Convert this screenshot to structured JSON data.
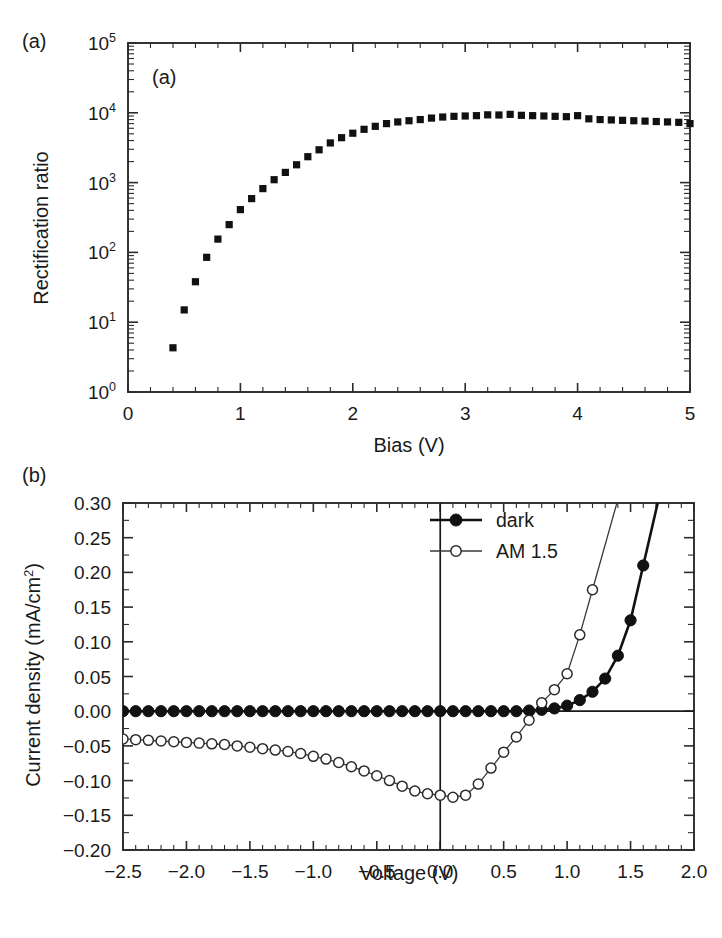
{
  "figure": {
    "panel_a_letter": "(a)",
    "panel_b_letter": "(b)",
    "panel_a_inner_letter": "(a)",
    "panel_b_inner_letter": "(b)"
  },
  "chart_data": [
    {
      "type": "scatter",
      "panel": "(a)",
      "title": "",
      "xlabel": "Bias (V)",
      "ylabel": "Rectification ratio",
      "xlim": [
        0,
        5
      ],
      "ylim": [
        1,
        100000
      ],
      "yscale": "log",
      "grid": false,
      "legend": "none",
      "xticks": [
        0,
        1,
        2,
        3,
        4,
        5
      ],
      "xticklabels": [
        "0",
        "1",
        "2",
        "3",
        "4",
        "5"
      ],
      "xminor_step": 0.2,
      "yticks": [
        1,
        10,
        100,
        1000,
        10000,
        100000
      ],
      "yticklabels": [
        "10^0",
        "10^1",
        "10^2",
        "10^3",
        "10^4",
        "10^5"
      ],
      "marker": "filled-square",
      "x": [
        0.4,
        0.5,
        0.6,
        0.7,
        0.8,
        0.9,
        1.0,
        1.1,
        1.2,
        1.3,
        1.4,
        1.5,
        1.6,
        1.7,
        1.8,
        1.9,
        2.0,
        2.1,
        2.2,
        2.3,
        2.4,
        2.5,
        2.6,
        2.7,
        2.8,
        2.9,
        3.0,
        3.1,
        3.2,
        3.3,
        3.4,
        3.5,
        3.6,
        3.7,
        3.8,
        3.9,
        4.0,
        4.1,
        4.2,
        4.3,
        4.4,
        4.5,
        4.6,
        4.7,
        4.8,
        4.9,
        5.0
      ],
      "y": [
        4.3,
        15,
        38,
        85,
        155,
        250,
        410,
        590,
        820,
        1100,
        1400,
        1800,
        2350,
        2950,
        3700,
        4400,
        5100,
        5800,
        6400,
        7000,
        7400,
        7700,
        8000,
        8400,
        8700,
        8900,
        9000,
        9100,
        9350,
        9300,
        9500,
        9200,
        9100,
        9000,
        8900,
        8800,
        9100,
        8200,
        8000,
        7900,
        7800,
        7700,
        7600,
        7500,
        7400,
        7300,
        7000
      ]
    },
    {
      "type": "line",
      "panel": "(b)",
      "title": "",
      "xlabel": "Voltage (V)",
      "ylabel": "Current density (mA/cm2)",
      "ylabel_display": "Current density (mA/cm",
      "ylabel_sup": "2",
      "ylabel_tail": ")",
      "xlim": [
        -2.5,
        2.0
      ],
      "ylim": [
        -0.2,
        0.3
      ],
      "grid": false,
      "legend": "upper-center",
      "xticks": [
        -2.5,
        -2.0,
        -1.5,
        -1.0,
        -0.5,
        0.0,
        0.5,
        1.0,
        1.5,
        2.0
      ],
      "xticklabels": [
        "-2.5",
        "-2.0",
        "-1.5",
        "-1.0",
        "-0.5",
        "0.0",
        "0.5",
        "1.0",
        "1.5",
        "2.0"
      ],
      "xminor_step": 0.1,
      "yticks": [
        -0.2,
        -0.15,
        -0.1,
        -0.05,
        0.0,
        0.05,
        0.1,
        0.15,
        0.2,
        0.25,
        0.3
      ],
      "yticklabels": [
        "-0.20",
        "-0.15",
        "-0.10",
        "-0.05",
        "0.00",
        "0.05",
        "0.10",
        "0.15",
        "0.20",
        "0.25",
        "0.30"
      ],
      "series": [
        {
          "name": "dark",
          "marker": "filled-circle",
          "linewidth": "thick",
          "x": [
            -2.5,
            -2.4,
            -2.3,
            -2.2,
            -2.1,
            -2.0,
            -1.9,
            -1.8,
            -1.7,
            -1.6,
            -1.5,
            -1.4,
            -1.3,
            -1.2,
            -1.1,
            -1.0,
            -0.9,
            -0.8,
            -0.7,
            -0.6,
            -0.5,
            -0.4,
            -0.3,
            -0.2,
            -0.1,
            0.0,
            0.1,
            0.2,
            0.3,
            0.4,
            0.5,
            0.6,
            0.7,
            0.8,
            0.9,
            1.0,
            1.1,
            1.2,
            1.3,
            1.4,
            1.5,
            1.6
          ],
          "y": [
            0.0,
            0.0,
            0.0,
            0.0,
            0.0,
            0.0,
            0.0,
            0.0,
            0.0,
            0.0,
            0.0,
            0.0,
            0.0,
            0.0,
            0.0,
            0.0,
            0.0,
            0.0,
            0.0,
            0.0,
            0.0,
            0.0,
            0.0,
            0.0,
            0.0,
            0.0,
            0.0,
            0.0,
            0.0,
            0.0,
            0.0,
            0.0,
            0.001,
            0.002,
            0.004,
            0.008,
            0.016,
            0.028,
            0.047,
            0.08,
            0.131,
            0.21
          ]
        },
        {
          "name": "AM 1.5",
          "marker": "open-circle",
          "linewidth": "thin",
          "x": [
            -2.5,
            -2.4,
            -2.3,
            -2.2,
            -2.1,
            -2.0,
            -1.9,
            -1.8,
            -1.7,
            -1.6,
            -1.5,
            -1.4,
            -1.3,
            -1.2,
            -1.1,
            -1.0,
            -0.9,
            -0.8,
            -0.7,
            -0.6,
            -0.5,
            -0.4,
            -0.3,
            -0.2,
            -0.1,
            0.0,
            0.1,
            0.2,
            0.3,
            0.4,
            0.5,
            0.6,
            0.7,
            0.8,
            0.9,
            1.0,
            1.1,
            1.2
          ],
          "y": [
            -0.04,
            -0.041,
            -0.042,
            -0.043,
            -0.044,
            -0.045,
            -0.046,
            -0.047,
            -0.048,
            -0.05,
            -0.052,
            -0.054,
            -0.056,
            -0.058,
            -0.061,
            -0.065,
            -0.069,
            -0.074,
            -0.08,
            -0.086,
            -0.093,
            -0.1,
            -0.108,
            -0.115,
            -0.119,
            -0.121,
            -0.124,
            -0.121,
            -0.105,
            -0.082,
            -0.059,
            -0.037,
            -0.013,
            0.012,
            0.031,
            0.054,
            0.11,
            0.175
          ]
        }
      ],
      "legend_items": [
        {
          "label": "dark",
          "marker": "filled-circle"
        },
        {
          "label": "AM 1.5",
          "marker": "open-circle"
        }
      ]
    }
  ]
}
